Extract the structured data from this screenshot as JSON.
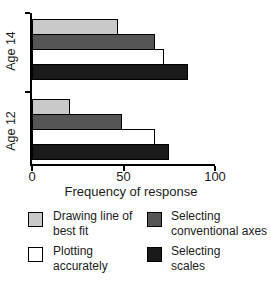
{
  "chart_data": {
    "type": "bar",
    "orientation": "horizontal",
    "xlabel": "Frequency of response",
    "xlim": [
      0,
      100
    ],
    "xticks": [
      "0",
      "50",
      "100"
    ],
    "groups": [
      "Age 14",
      "Age 12"
    ],
    "series": [
      {
        "name": "Drawing line of best fit",
        "color": "#c9c9c9",
        "values": [
          47,
          21
        ]
      },
      {
        "name": "Selecting conventional axes",
        "color": "#555555",
        "values": [
          67,
          49
        ]
      },
      {
        "name": "Plotting accurately",
        "color": "#ffffff",
        "values": [
          72,
          67
        ]
      },
      {
        "name": "Selecting scales",
        "color": "#1a1a1a",
        "values": [
          85,
          75
        ]
      }
    ],
    "grid": false,
    "legend_position": "bottom"
  },
  "legend": {
    "items": [
      {
        "label": "Drawing line of best fit",
        "color": "#c9c9c9"
      },
      {
        "label": "Plotting accurately",
        "color": "#ffffff"
      },
      {
        "label": "Selecting conventional axes",
        "color": "#555555"
      },
      {
        "label": "Selecting scales",
        "color": "#1a1a1a"
      }
    ]
  }
}
